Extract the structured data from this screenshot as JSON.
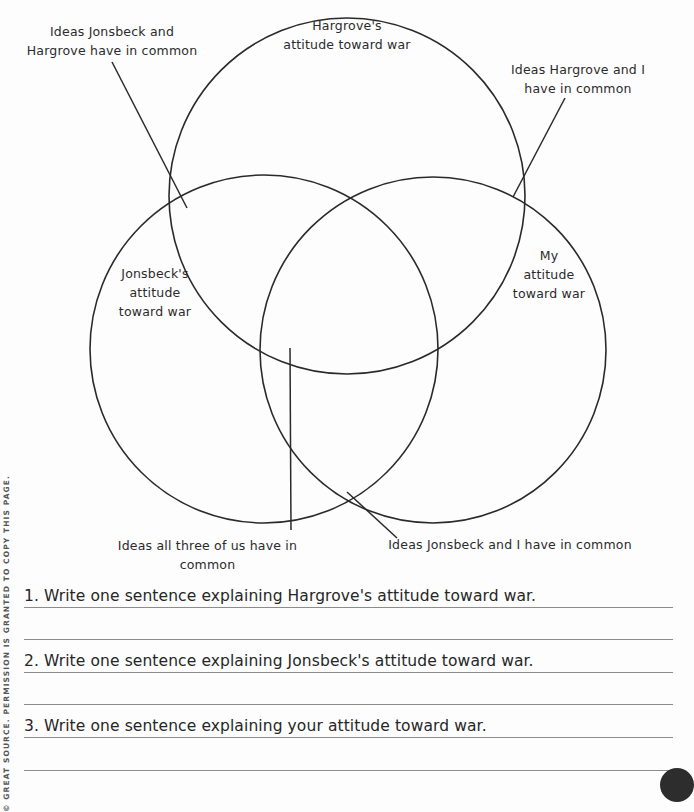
{
  "diagram": {
    "type": "three-circle venn diagram",
    "circles": [
      {
        "id": "hargrove",
        "label": "Hargrove's attitude toward war",
        "lines": [
          "Hargrove's",
          "attitude toward war"
        ]
      },
      {
        "id": "jonsbeck",
        "label": "Jonsbeck's attitude toward war",
        "lines": [
          "Jonsbeck's",
          "attitude",
          "toward war"
        ]
      },
      {
        "id": "me",
        "label": "My attitude toward war",
        "lines": [
          "My",
          "attitude",
          "toward war"
        ]
      }
    ],
    "callouts": {
      "jonsbeck_hargrove": {
        "line1": "Ideas Jonsbeck and",
        "line2": "Hargrove have in common"
      },
      "hargrove_me": {
        "line1": "Ideas Hargrove and I",
        "line2": "have in common"
      },
      "all_three": {
        "line1": "Ideas all three of us have in",
        "line2": "common"
      },
      "jonsbeck_me": {
        "line1": "Ideas Jonsbeck and I have in common"
      }
    },
    "stroke_color": "#2a2a2a"
  },
  "questions": [
    {
      "number": "1.",
      "text": "1. Write one sentence explaining Hargrove's attitude toward war."
    },
    {
      "number": "2.",
      "text": "2. Write one sentence explaining Jonsbeck's attitude toward war."
    },
    {
      "number": "3.",
      "text": "3. Write one sentence explaining your attitude toward war."
    }
  ],
  "footer": {
    "copyright": "© GREAT SOURCE. PERMISSION IS GRANTED TO COPY THIS PAGE."
  }
}
